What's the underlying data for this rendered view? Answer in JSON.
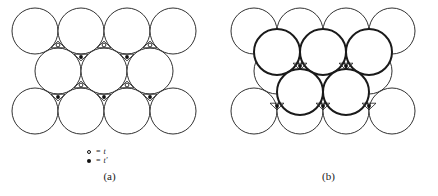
{
  "figure": {
    "type": "crystal-structure-diagram",
    "stroke_color": "#1a1a1a",
    "fill_color": "#ffffff",
    "marker_color": "#111111"
  },
  "panel_a": {
    "caption": "(a)",
    "legend": [
      {
        "symbol": "open-circle",
        "equals": "=",
        "value": "t"
      },
      {
        "symbol": "filled-circle",
        "equals": "=",
        "value": "t′"
      }
    ],
    "geometry": {
      "radius": 23,
      "row_dy": 40,
      "rows": [
        {
          "name": "top-row",
          "cy": 31,
          "cx": [
            35,
            81,
            127,
            173
          ],
          "stroke_width": 0.9
        },
        {
          "name": "middle-row",
          "cy": 71,
          "cx": [
            58,
            104,
            150
          ],
          "stroke_width": 0.9
        },
        {
          "name": "bottom-row",
          "cy": 111,
          "cx": [
            35,
            81,
            127,
            173
          ],
          "stroke_width": 0.9
        }
      ],
      "sites_open": [
        {
          "name": "t-site",
          "cx": 58,
          "cy": 45
        },
        {
          "name": "t-site",
          "cx": 104,
          "cy": 45
        },
        {
          "name": "t-site",
          "cx": 150,
          "cy": 45
        },
        {
          "name": "t-site",
          "cx": 81,
          "cy": 85
        },
        {
          "name": "t-site",
          "cx": 127,
          "cy": 85
        }
      ],
      "sites_filled": [
        {
          "name": "t-prime-site",
          "cx": 81,
          "cy": 57
        },
        {
          "name": "t-prime-site",
          "cx": 127,
          "cy": 57
        },
        {
          "name": "t-prime-site",
          "cx": 58,
          "cy": 97
        },
        {
          "name": "t-prime-site",
          "cx": 104,
          "cy": 97
        },
        {
          "name": "t-prime-site",
          "cx": 150,
          "cy": 97
        }
      ]
    }
  },
  "panel_b": {
    "caption": "(b)",
    "legend": [
      {
        "symbol": "filled-circle",
        "equals": "=",
        "value": "o"
      }
    ],
    "geometry": {
      "radius": 23,
      "rows_base": [
        {
          "name": "top-row",
          "cy": 31,
          "cx": [
            35,
            81,
            127,
            173
          ],
          "stroke_width": 0.9
        },
        {
          "name": "middle-row",
          "cy": 71,
          "cx": [
            58,
            104,
            150
          ],
          "stroke_width": 0.9
        },
        {
          "name": "bottom-row",
          "cy": 111,
          "cx": [
            35,
            81,
            127,
            173
          ],
          "stroke_width": 0.9
        }
      ],
      "rows_overlay": [
        {
          "name": "overlay-upper-row",
          "cy": 52,
          "cx": [
            58,
            104,
            150
          ],
          "stroke_width": 2.0
        },
        {
          "name": "overlay-lower-row",
          "cy": 92,
          "cx": [
            81,
            127
          ],
          "stroke_width": 2.0
        }
      ],
      "sites_filled": [
        {
          "name": "o-site",
          "cx": 81,
          "cy": 66
        },
        {
          "name": "o-site",
          "cx": 127,
          "cy": 66
        },
        {
          "name": "o-site",
          "cx": 58,
          "cy": 106
        },
        {
          "name": "o-site",
          "cx": 104,
          "cy": 106
        },
        {
          "name": "o-site",
          "cx": 150,
          "cy": 106
        }
      ]
    }
  }
}
